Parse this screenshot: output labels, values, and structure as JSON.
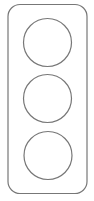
{
  "figure": {
    "type": "traffic-light-outline",
    "stroke_color": "#777777",
    "background": "#ffffff",
    "lights": [
      {
        "position": "top"
      },
      {
        "position": "middle"
      },
      {
        "position": "bottom"
      }
    ]
  }
}
